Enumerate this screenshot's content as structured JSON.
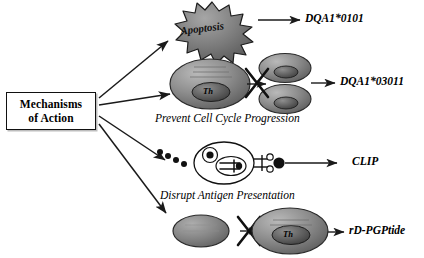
{
  "figure": {
    "source_box": {
      "line1": "Mechanisms",
      "line2": "of  Action"
    },
    "branches": [
      {
        "id": "apoptosis",
        "icon": "starburst-apoptosis",
        "icon_label": "Apoptosis",
        "caption": "",
        "agent": "DQA1*0101"
      },
      {
        "id": "cell-cycle",
        "icon": "cell-division-blocked",
        "icon_label": "Th",
        "caption": "Prevent Cell Cycle Progression",
        "agent": "DQA1*03011"
      },
      {
        "id": "antigen-presentation",
        "icon": "antigen-presenting-cell",
        "icon_label": "",
        "caption": "Disrupt Antigen Presentation",
        "agent": "CLIP"
      },
      {
        "id": "th-activation",
        "icon": "cell-activation-blocked",
        "icon_label": "Th",
        "caption": "",
        "agent": "rD-PGPtide"
      }
    ],
    "colors": {
      "ink": "#111111",
      "cell_fill": "#8a8a8a",
      "cell_dark": "#4a4a4a",
      "burst_fill": "#7e7e7e",
      "background": "#ffffff"
    }
  }
}
